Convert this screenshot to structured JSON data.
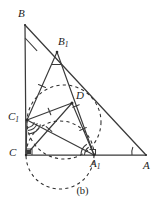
{
  "figure": {
    "caption": "(b)",
    "stroke_color": "#3a3a3a",
    "dash_color": "#2e2e2e",
    "background": "#ffffff",
    "vertices": [
      {
        "id": "B",
        "label": "B",
        "sub": "",
        "x": 25,
        "y": 25,
        "label_x": 18,
        "label_y": 8
      },
      {
        "id": "B1",
        "label": "B",
        "sub": "1",
        "x": 57,
        "y": 52,
        "label_x": 58,
        "label_y": 36
      },
      {
        "id": "D",
        "label": "D",
        "sub": "",
        "x": 72,
        "y": 103,
        "label_x": 76,
        "label_y": 90
      },
      {
        "id": "C1",
        "label": "C",
        "sub": "1",
        "x": 27,
        "y": 120,
        "label_x": 8,
        "label_y": 111
      },
      {
        "id": "C",
        "label": "C",
        "sub": "",
        "x": 26,
        "y": 155,
        "label_x": 9,
        "label_y": 147
      },
      {
        "id": "A1",
        "label": "A",
        "sub": "1",
        "x": 94,
        "y": 155,
        "label_x": 90,
        "label_y": 158
      },
      {
        "id": "A",
        "label": "A",
        "sub": "",
        "x": 146,
        "y": 155,
        "label_x": 143,
        "label_y": 160
      }
    ],
    "solid_segments": [
      {
        "name": "side-BC",
        "from": "B",
        "to": "C"
      },
      {
        "name": "side-CA",
        "from": "C",
        "to": "A"
      },
      {
        "name": "side-BA",
        "from": "B",
        "to": "A"
      },
      {
        "name": "seg-B1C1",
        "from": "B1",
        "to": "C1"
      },
      {
        "name": "seg-B1A1",
        "from": "B1",
        "to": "A1"
      },
      {
        "name": "seg-C1A1",
        "from": "C1",
        "to": "A1"
      },
      {
        "name": "seg-C1D",
        "from": "C1",
        "to": "D"
      },
      {
        "name": "seg-DA1",
        "from": "D",
        "to": "A1"
      },
      {
        "name": "seg-CD",
        "from": "C",
        "to": "D"
      },
      {
        "name": "seg-C1C",
        "from": "C1",
        "to": "C"
      }
    ],
    "dashed_circles": [
      {
        "name": "incircle-dashed",
        "cx": 64,
        "cy": 122,
        "r": 37
      },
      {
        "name": "circumcircle-dashed-lower",
        "cx": 60,
        "cy": 155,
        "r": 34
      }
    ],
    "tick_marks": [
      {
        "name": "tick-B1C1",
        "t": 0.5,
        "on": "seg-B1C1",
        "count": 1
      },
      {
        "name": "tick-B1A1",
        "t": 0.52,
        "on": "seg-B1A1",
        "count": 1
      },
      {
        "name": "tick-C1D",
        "t": 0.5,
        "on": "seg-C1D",
        "count": 1
      },
      {
        "name": "tick-DA1",
        "t": 0.5,
        "on": "seg-DA1",
        "count": 1
      },
      {
        "name": "tick-CD",
        "t": 0.52,
        "on": "seg-CD",
        "count": 1
      }
    ],
    "angle_marks": [
      {
        "name": "angle-at-B",
        "vertex": "B",
        "radius": 13
      },
      {
        "name": "angle-at-B1",
        "vertex": "B1",
        "radius": 13
      },
      {
        "name": "angle-at-A",
        "vertex": "A",
        "radius": 14
      },
      {
        "name": "angle-at-C1",
        "vertex": "C1",
        "radius": 12
      },
      {
        "name": "angle-at-A1",
        "vertex": "A1",
        "radius": 11
      },
      {
        "name": "right-angle-at-C",
        "vertex": "C",
        "size": 5
      }
    ]
  }
}
